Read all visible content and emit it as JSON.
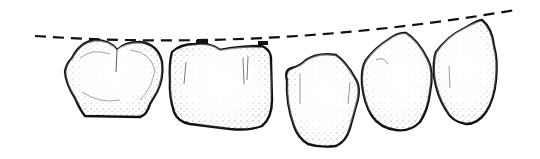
{
  "figure": {
    "background": "#ffffff",
    "stroke_color": "#111111",
    "teeth_count": 5,
    "reference_line": {
      "style": "dashed",
      "color": "#111111"
    }
  }
}
